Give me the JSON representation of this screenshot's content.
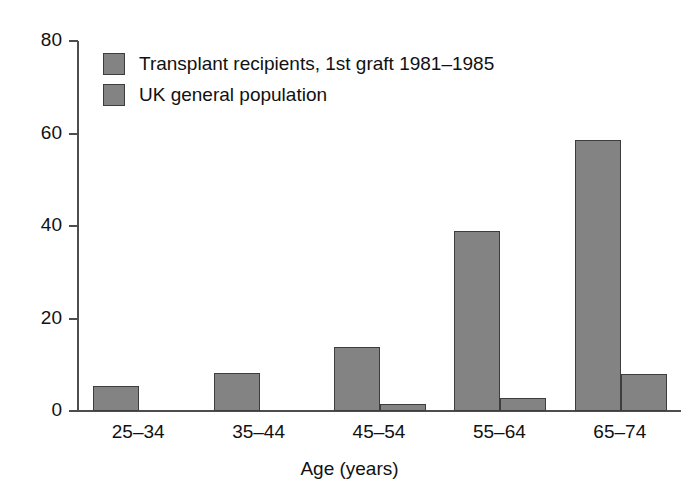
{
  "chart_data": {
    "type": "bar",
    "title": "",
    "xlabel": "Age (years)",
    "ylabel": "",
    "categories": [
      "25–34",
      "35–44",
      "45–54",
      "55–64",
      "65–74"
    ],
    "series": [
      {
        "name": "Transplant recipients, 1st graft 1981–1985",
        "color": "#838383",
        "values": [
          5.5,
          8.3,
          13.8,
          39.0,
          58.5
        ]
      },
      {
        "name": "UK general population",
        "color": "#838383",
        "values": [
          0,
          0,
          1.6,
          2.9,
          8.0
        ]
      }
    ],
    "ylim": [
      0,
      80
    ],
    "yticks": [
      0,
      20,
      40,
      60,
      80
    ],
    "ytick_labels": [
      "0",
      "20",
      "40",
      "60",
      "80"
    ],
    "grid": false,
    "legend_position": "upper left",
    "bar_fill_color": "#838383",
    "bar_border_color": "#3d3d3d",
    "axis_color": "#4d4d4d",
    "background_color": "#ffffff"
  }
}
